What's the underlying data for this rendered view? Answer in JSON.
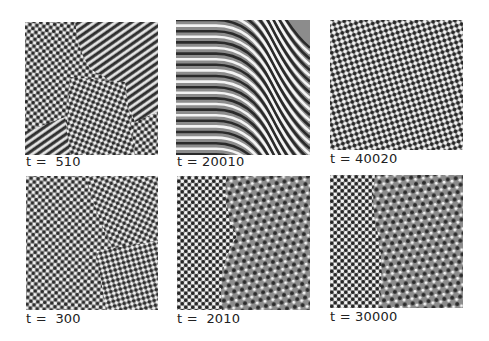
{
  "figure": {
    "panels": [
      {
        "id": "top-left",
        "label": "t =  510",
        "pattern": "mixed-squares-stripes",
        "x": 25,
        "y": 22,
        "w": 133,
        "h": 133,
        "label_x": 26,
        "label_y": 155
      },
      {
        "id": "top-middle",
        "label": "t = 20010",
        "pattern": "curved-stripes",
        "x": 176,
        "y": 20,
        "w": 134,
        "h": 135,
        "label_x": 177,
        "label_y": 155
      },
      {
        "id": "top-right",
        "label": "t = 40020",
        "pattern": "diagonal-squares",
        "x": 330,
        "y": 20,
        "w": 133,
        "h": 130,
        "label_x": 330,
        "label_y": 152
      },
      {
        "id": "bottom-left",
        "label": "t =  300",
        "pattern": "disordered-squares",
        "x": 26,
        "y": 176,
        "w": 132,
        "h": 134,
        "label_x": 26,
        "label_y": 312
      },
      {
        "id": "bottom-middle",
        "label": "t =  2010",
        "pattern": "squares-hexagons",
        "x": 177,
        "y": 176,
        "w": 133,
        "h": 134,
        "label_x": 177,
        "label_y": 312
      },
      {
        "id": "bottom-right",
        "label": "t = 30000",
        "pattern": "squares-hexagons-front",
        "x": 330,
        "y": 175,
        "w": 133,
        "h": 133,
        "label_x": 330,
        "label_y": 310
      }
    ]
  },
  "colors": {
    "light": "#f4f4f4",
    "mid": "#8c8c8c",
    "dark": "#2a2a2a",
    "label": "#222222"
  }
}
